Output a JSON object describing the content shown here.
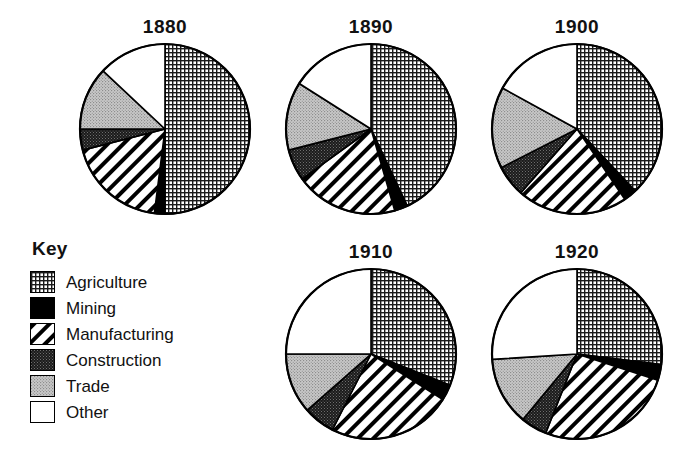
{
  "legend": {
    "heading": "Key",
    "items": [
      {
        "label": "Agriculture",
        "pattern": "grid-crosshatch",
        "swatch_name": "swatch-agriculture"
      },
      {
        "label": "Mining",
        "pattern": "solid-black",
        "swatch_name": "swatch-mining"
      },
      {
        "label": "Manufacturing",
        "pattern": "diagonal-stripes",
        "swatch_name": "swatch-manufacturing"
      },
      {
        "label": "Construction",
        "pattern": "dark-stipple",
        "swatch_name": "swatch-construction"
      },
      {
        "label": "Trade",
        "pattern": "light-gray-stipple",
        "swatch_name": "swatch-trade"
      },
      {
        "label": "Other",
        "pattern": "white",
        "swatch_name": "swatch-other"
      }
    ]
  },
  "colors": {
    "outline": "#000000",
    "agriculture": "#ffffff",
    "mining": "#000000",
    "manufacturing": "#ffffff",
    "construction": "#333333",
    "trade": "#b4b4b4",
    "other": "#ffffff"
  },
  "chart_data": {
    "type": "pie",
    "title": "",
    "legend_position": "left-bottom",
    "categories": [
      "Agriculture",
      "Mining",
      "Manufacturing",
      "Construction",
      "Trade",
      "Other"
    ],
    "units": "percent of labor force",
    "start_angle_deg": 0,
    "direction": "clockwise",
    "charts": [
      {
        "title": "1880",
        "cx": 165,
        "cy": 129,
        "r": 85,
        "values": [
          50.0,
          2.0,
          19.0,
          4.0,
          12.0,
          13.0
        ]
      },
      {
        "title": "1890",
        "cx": 371,
        "cy": 129,
        "r": 85,
        "values": [
          43.0,
          2.5,
          19.5,
          6.0,
          13.0,
          16.0
        ]
      },
      {
        "title": "1900",
        "cx": 577,
        "cy": 129,
        "r": 85,
        "values": [
          38.0,
          2.5,
          21.0,
          6.0,
          15.5,
          17.0
        ]
      },
      {
        "title": "1910",
        "cx": 371,
        "cy": 354,
        "r": 85,
        "values": [
          31.0,
          3.0,
          23.5,
          6.0,
          11.5,
          25.0
        ]
      },
      {
        "title": "1920",
        "cx": 577,
        "cy": 354,
        "r": 85,
        "values": [
          27.0,
          3.0,
          26.0,
          5.0,
          13.0,
          26.0
        ]
      }
    ]
  }
}
